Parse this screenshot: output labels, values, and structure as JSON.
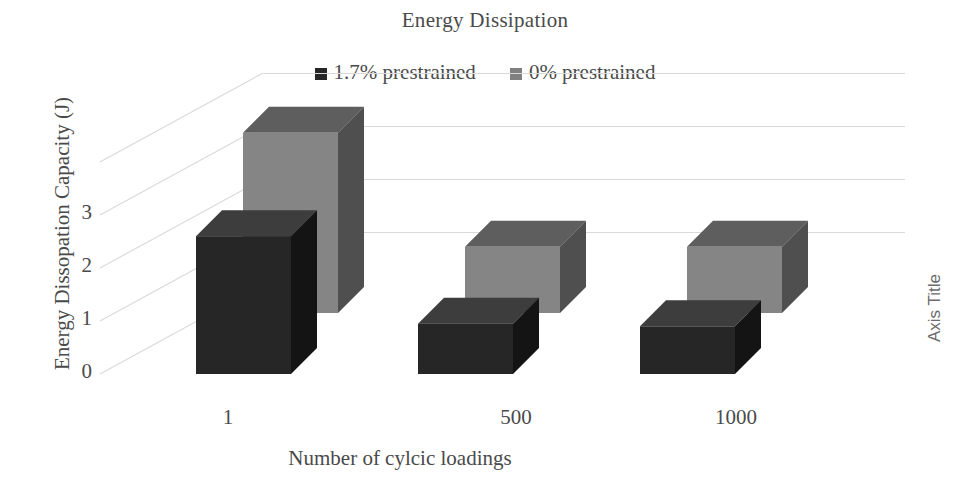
{
  "chart_data": {
    "type": "bar",
    "title": "Energy Dissipation",
    "xlabel": "Number of cylcic loadings",
    "ylabel": "Energy Dissopation Capacity (J)",
    "secondary_axis_label": "Axis Title",
    "categories": [
      "1",
      "500",
      "1000"
    ],
    "ytick_labels": [
      "3",
      "2",
      "1",
      "0"
    ],
    "ylim": [
      0,
      4
    ],
    "ytick_values": [
      3,
      2,
      1,
      0
    ],
    "grid": true,
    "grid_style": "horizontal-3d-backwall",
    "legend_position": "top-center",
    "three_d": true,
    "series": [
      {
        "name": "1.7% prestrained",
        "color": "#262626",
        "values": [
          2.6,
          0.95,
          0.9
        ]
      },
      {
        "name": "0% prestrained",
        "color": "#808080",
        "values": [
          3.4,
          1.25,
          1.25
        ]
      }
    ]
  },
  "legend": {
    "items": [
      {
        "label": "1.7% prestrained",
        "color": "#262626"
      },
      {
        "label": "0% prestrained",
        "color": "#808080"
      }
    ]
  },
  "axes": {
    "y_title": "Energy Dissopation Capacity (J)",
    "x_title": "Number of cylcic loadings",
    "secondary_title": "Axis Title",
    "y_ticks": [
      "3",
      "2",
      "1",
      "0"
    ],
    "x_ticks": [
      "1",
      "500",
      "1000"
    ]
  },
  "colors": {
    "series_dark_front": "#262626",
    "series_dark_top": "#3d3d3d",
    "series_dark_side": "#141414",
    "series_gray_front": "#858585",
    "series_gray_top": "#5e5e5e",
    "series_gray_side": "#4f4f4f",
    "gridline": "#d9d9d9",
    "text": "#4a4a4a"
  }
}
